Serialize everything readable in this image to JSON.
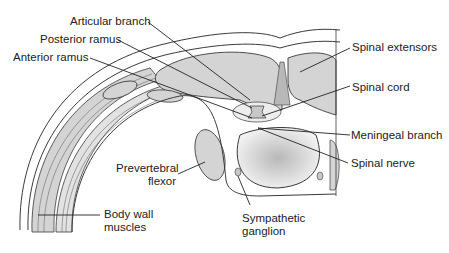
{
  "diagram": {
    "labels": {
      "articular_branch": "Articular branch",
      "posterior_ramus": "Posterior ramus",
      "anterior_ramus": "Anterior ramus",
      "spinal_extensors": "Spinal extensors",
      "spinal_cord": "Spinal cord",
      "meningeal_branch": "Meningeal branch",
      "spinal_nerve": "Spinal nerve",
      "prevertebral_flexor_line1": "Prevertebral",
      "prevertebral_flexor_line2": "flexor",
      "body_wall_muscles_line1": "Body wall",
      "body_wall_muscles_line2": "muscles",
      "sympathetic_ganglion_line1": "Sympathetic",
      "sympathetic_ganglion_line2": "ganglion"
    },
    "colors": {
      "muscle_fill": "#d4d4d4",
      "outline": "#3a3a3a",
      "cord_fill": "#c8c8c8",
      "body_fill": "#efefef",
      "background": "#ffffff"
    }
  }
}
